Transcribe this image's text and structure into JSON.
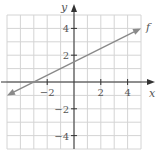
{
  "chart_data": {
    "type": "line",
    "title": "",
    "xlabel": "x",
    "ylabel": "y",
    "xlim": [
      -5,
      5
    ],
    "ylim": [
      -5,
      5
    ],
    "grid": true,
    "grid_step": 1,
    "x_ticks": [
      -2,
      2,
      4
    ],
    "y_ticks": [
      4,
      2,
      -2,
      -4
    ],
    "x_tick_labels": [
      "−2",
      "2",
      "4"
    ],
    "y_tick_labels": [
      "4",
      "2",
      "−2",
      "−4"
    ],
    "series": [
      {
        "name": "f",
        "label": "f",
        "equation": "y = 0.5x + 1.5",
        "x": [
          -5,
          -3,
          0,
          5
        ],
        "y": [
          -1,
          0,
          1.5,
          4
        ],
        "arrows": "both",
        "color": "#8a8a8a"
      }
    ],
    "legend": "none"
  },
  "colors": {
    "grid": "#d4d4d4",
    "axis": "#333333",
    "line": "#8a8a8a",
    "text": "#555555"
  }
}
